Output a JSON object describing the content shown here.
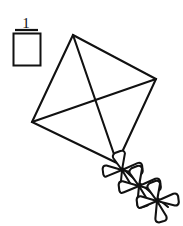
{
  "worksheet": {
    "background_color": "#ffffff",
    "ink_color": "#111111",
    "question_number": "1",
    "answer_box": {
      "label": "",
      "value": "",
      "x": 13,
      "y": 33,
      "width": 28,
      "height": 33,
      "fill": "#ffffff",
      "stroke": "#111111"
    },
    "number_underline": {
      "x1": 15,
      "y1": 30,
      "x2": 38,
      "y2": 30
    }
  },
  "figure": {
    "name": "kite-with-bow-tail",
    "stroke_color": "#111111",
    "stroke_width": 2.1,
    "kite": {
      "top_vertex": {
        "x": 73,
        "y": 35
      },
      "right_vertex": {
        "x": 156,
        "y": 79
      },
      "bottom_vertex": {
        "x": 117,
        "y": 163
      },
      "left_vertex": {
        "x": 32,
        "y": 122
      },
      "cross_center": {
        "x": 95,
        "y": 102
      },
      "outline_points": "73,35 156,79 117,163 32,122",
      "spar_vertical": {
        "x1": 73,
        "y1": 35,
        "x2": 117,
        "y2": 163
      },
      "spar_horizontal": {
        "x1": 32,
        "y1": 122,
        "x2": 156,
        "y2": 79
      }
    },
    "tail": {
      "string_points": "117,163 131,176 148,190 168,207",
      "bow_count": 3,
      "bows": [
        {
          "name": "bow-1",
          "cx": 122,
          "cy": 170,
          "scale": 1.0,
          "rotation": 38
        },
        {
          "name": "bow-2",
          "cx": 139,
          "cy": 186,
          "scale": 1.05,
          "rotation": 38
        },
        {
          "name": "bow-3",
          "cx": 157,
          "cy": 201,
          "scale": 1.05,
          "rotation": 38
        }
      ]
    }
  }
}
